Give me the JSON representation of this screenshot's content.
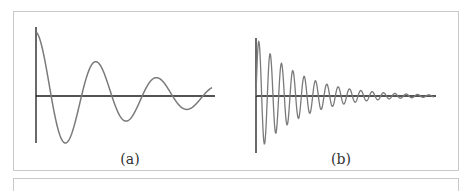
{
  "figure": {
    "panels": [
      {
        "id": "a",
        "label": "(a)",
        "description": "Damped oscillation, low frequency, lightly damped",
        "curve": {
          "amplitude": 1.0,
          "decay": 0.55,
          "cycles": 2.9,
          "phase": "cosine"
        }
      },
      {
        "id": "b",
        "label": "(b)",
        "description": "Damped oscillation, high frequency",
        "curve": {
          "amplitude": 1.0,
          "decay": 0.25,
          "cycles": 15.7,
          "phase": "sine"
        }
      }
    ],
    "colors": {
      "axis": "#1a1a1a",
      "curve": "#7a7a7a",
      "border": "#c9c9c9"
    }
  }
}
